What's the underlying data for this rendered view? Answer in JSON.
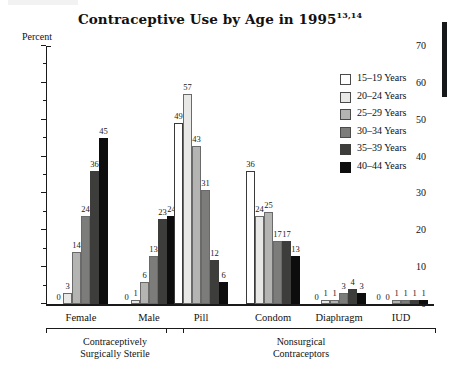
{
  "chart_data": {
    "type": "bar",
    "title": "Contraceptive Use by Age in 1995",
    "title_superscript": "13,14",
    "xlabel": "",
    "ylabel": "Percent",
    "ylim": [
      0,
      70
    ],
    "ytick_step": 10,
    "yticks": [
      0,
      10,
      20,
      30,
      40,
      50,
      60,
      70
    ],
    "ytick_labels": [
      "0",
      "10",
      "20",
      "30",
      "40",
      "50",
      "60",
      "70"
    ],
    "minor_tick_step": 5,
    "grid": false,
    "legend_position": "upper right",
    "categories": [
      "Female",
      "Male",
      "Pill",
      "Condom",
      "Diaphragm",
      "IUD"
    ],
    "supercategories": [
      {
        "label": "Contraceptively\nSurgically Sterile",
        "line1": "Contraceptively",
        "line2": "Surgically Sterile",
        "spans": [
          "Female",
          "Male"
        ]
      },
      {
        "label": "Nonsurgical\nContraceptors",
        "line1": "Nonsurgical",
        "line2": "Contraceptors",
        "spans": [
          "Pill",
          "Condom",
          "Diaphragm",
          "IUD"
        ]
      }
    ],
    "series": [
      {
        "name": "15–19 Years",
        "color": "#ffffff",
        "values": [
          0,
          0,
          49,
          36,
          0,
          0
        ]
      },
      {
        "name": "20–24 Years",
        "color": "#e8e8e6",
        "values": [
          3,
          1,
          57,
          24,
          1,
          0
        ]
      },
      {
        "name": "25–29 Years",
        "color": "#b4b4b2",
        "values": [
          14,
          6,
          43,
          25,
          1,
          1
        ]
      },
      {
        "name": "30–34 Years",
        "color": "#7c7c7a",
        "values": [
          24,
          13,
          31,
          17,
          3,
          1
        ]
      },
      {
        "name": "35–39 Years",
        "color": "#3d3d3c",
        "values": [
          36,
          23,
          12,
          17,
          4,
          1
        ]
      },
      {
        "name": "40–44 Years",
        "color": "#0d0d0d",
        "values": [
          45,
          24,
          6,
          13,
          3,
          1
        ]
      }
    ],
    "bar_labels": {
      "Female": [
        "0",
        "3",
        "14",
        "24",
        "36",
        "45"
      ],
      "Male": [
        "0",
        "1",
        "6",
        "13",
        "23",
        "24"
      ],
      "Pill": [
        "49",
        "57",
        "43",
        "31",
        "12",
        "6"
      ],
      "Condom": [
        "36",
        "24",
        "25",
        "17",
        "17",
        "13"
      ],
      "Diaphragm": [
        "0",
        "1",
        "1",
        "3",
        "4",
        "3"
      ],
      "IUD": [
        "0",
        "0",
        "1",
        "1",
        "1",
        "1"
      ]
    }
  }
}
